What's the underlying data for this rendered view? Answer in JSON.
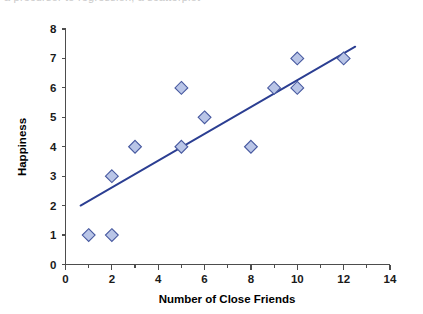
{
  "top_clipped_text": "a precursor to regression, a scatterplot",
  "chart_data": {
    "type": "scatter",
    "title": "",
    "xlabel": "Number of Close Friends",
    "ylabel": "Happiness",
    "xlim": [
      0,
      14
    ],
    "ylim": [
      0,
      8
    ],
    "grid": false,
    "legend": "none",
    "x_major_ticks": [
      0,
      2,
      4,
      6,
      8,
      10,
      12,
      14
    ],
    "x_minor_ticks": [
      1,
      3,
      5,
      7,
      9,
      11,
      13
    ],
    "x_tick_labels": [
      "0",
      "2",
      "4",
      "6",
      "8",
      "10",
      "12",
      "14"
    ],
    "y_ticks": [
      0,
      1,
      2,
      3,
      4,
      5,
      6,
      7,
      8
    ],
    "y_tick_labels": [
      "0",
      "1",
      "2",
      "3",
      "4",
      "5",
      "6",
      "7",
      "8"
    ],
    "series": [
      {
        "name": "observations",
        "marker": "diamond",
        "marker_fill": "#b9c5e7",
        "marker_edge": "#46589f",
        "points": [
          {
            "x": 1,
            "y": 1
          },
          {
            "x": 2,
            "y": 1
          },
          {
            "x": 2,
            "y": 3
          },
          {
            "x": 3,
            "y": 4
          },
          {
            "x": 5,
            "y": 4
          },
          {
            "x": 5,
            "y": 6
          },
          {
            "x": 6,
            "y": 5
          },
          {
            "x": 8,
            "y": 4
          },
          {
            "x": 9,
            "y": 6
          },
          {
            "x": 10,
            "y": 6
          },
          {
            "x": 10,
            "y": 7
          },
          {
            "x": 12,
            "y": 7
          }
        ]
      }
    ],
    "trendline": {
      "name": "line of best fit",
      "color": "#2b3e92",
      "x_start": 0.65,
      "y_start": 2.0,
      "x_end": 12.5,
      "y_end": 7.4
    }
  },
  "colors": {
    "axis": "#4d4d4d",
    "text": "#000000",
    "marker_fill": "#b9c5e7",
    "marker_edge": "#46589f",
    "trend": "#2b3e92",
    "background": "#ffffff"
  }
}
